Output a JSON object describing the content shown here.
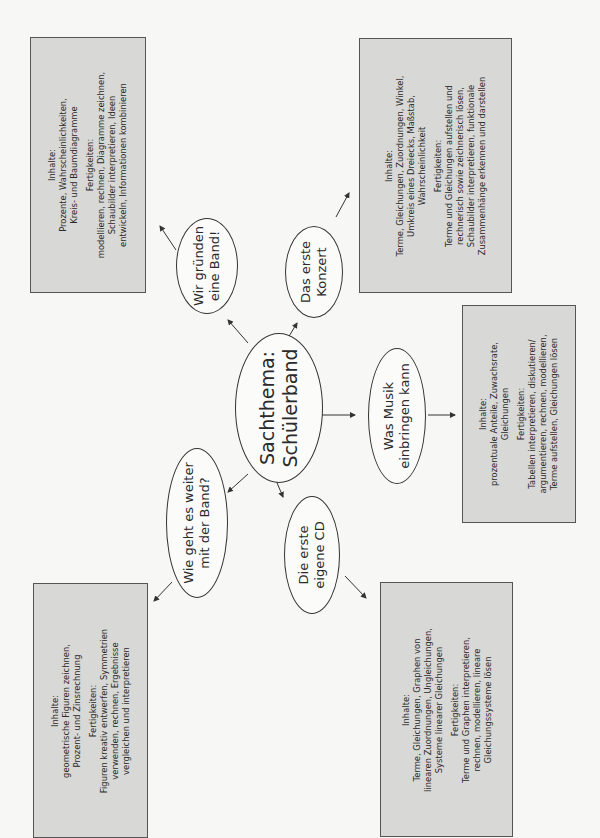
{
  "center": {
    "line1": "Sachthema:",
    "line2": "Schülerband"
  },
  "topics": [
    {
      "id": "band",
      "title": [
        "Wir gründen",
        "eine Band!"
      ],
      "inhalte_label": "Inhalte:",
      "inhalte": [
        "Prozente, Wahrscheinlichkeiten,",
        "Kreis- und Baumdiagramme"
      ],
      "fertigkeiten_label": "Fertigkeiten:",
      "fertigkeiten": [
        "modellieren, rechnen, Diagramme zeichnen,",
        "Schaubilder interpretieren, Ideen",
        "entwickeln, Informationen kombinieren"
      ]
    },
    {
      "id": "konzert",
      "title": [
        "Das erste",
        "Konzert"
      ],
      "inhalte_label": "Inhalte:",
      "inhalte": [
        "Terme, Gleichungen, Zuordnungen, Winkel,",
        "Umkreis eines Dreiecks, Maßstab,",
        "Wahrscheinlichkeit"
      ],
      "fertigkeiten_label": "Fertigkeiten:",
      "fertigkeiten": [
        "Terme und Gleichungen aufstellen und",
        "rechnerisch sowie zeichnerisch lösen,",
        "Schaubilder interpretieren, funktionale",
        "Zusammenhänge erkennen und darstellen"
      ]
    },
    {
      "id": "musik",
      "title": [
        "Was Musik",
        "einbringen kann"
      ],
      "inhalte_label": "Inhalte:",
      "inhalte": [
        "prozentuale Anteile, Zuwachsrate,",
        "Gleichungen"
      ],
      "fertigkeiten_label": "Fertigkeiten:",
      "fertigkeiten": [
        "Tabellen interpretieren, diskutieren/",
        "argumentieren, rechnen, modellieren,",
        "Terme aufstellen, Gleichungen lösen"
      ]
    },
    {
      "id": "weiter",
      "title": [
        "Wie geht es weiter",
        "mit der Band?"
      ],
      "inhalte_label": "Inhalte:",
      "inhalte": [
        "geometrische Figuren zeichnen,",
        "Prozent- und Zinsrechnung"
      ],
      "fertigkeiten_label": "Fertigkeiten:",
      "fertigkeiten": [
        "Figuren kreativ entwerfen, Symmetrien",
        "verwenden, rechnen, Ergebnisse",
        "vergleichen und interpretieren"
      ]
    },
    {
      "id": "cd",
      "title": [
        "Die erste",
        "eigene CD"
      ],
      "inhalte_label": "Inhalte:",
      "inhalte": [
        "Terme, Gleichungen, Graphen von",
        "linearen Zuordnungen, Ungleichungen,",
        "Systeme linearer Gleichungen"
      ],
      "fertigkeiten_label": "Fertigkeiten:",
      "fertigkeiten": [
        "Terme und Graphen interpretieren,",
        "rechnen, modellieren, lineare",
        "Gleichungssysteme lösen"
      ]
    }
  ],
  "colors": {
    "box_fill": "#d8d8d6",
    "box_border": "#555555",
    "line": "#333333",
    "background": "#f7f7f5"
  }
}
